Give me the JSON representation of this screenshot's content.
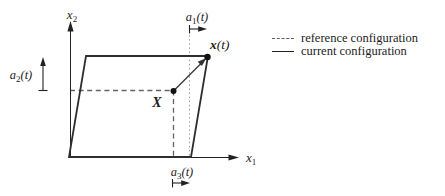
{
  "figure": {
    "axes": {
      "x1": {
        "base": "x",
        "sub": "1"
      },
      "x2": {
        "base": "x",
        "sub": "2"
      }
    },
    "measures": {
      "a1": {
        "base": "a",
        "sub": "1",
        "arg": "(t)"
      },
      "a2": {
        "base": "a",
        "sub": "2",
        "arg": "(t)"
      },
      "a3": {
        "base": "a",
        "sub": "3",
        "arg": "(t)"
      }
    },
    "points": {
      "material": {
        "label": "X"
      },
      "spatial": {
        "base": "x",
        "arg": "(t)"
      }
    },
    "colors": {
      "solid_line": "#2e2e2e",
      "axis_line": "#222222",
      "dashed_line": "#636363",
      "dotted_line": "#9a9a9a",
      "text": "#1c1c1c",
      "background": "#ffffff"
    }
  },
  "legend": {
    "items": [
      {
        "style": "dashed",
        "label": "reference configuration"
      },
      {
        "style": "solid",
        "label": "current configuration"
      }
    ]
  }
}
